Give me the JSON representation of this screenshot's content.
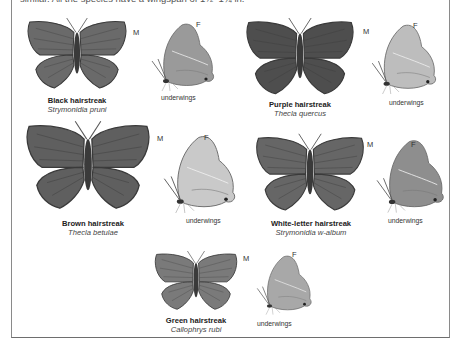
{
  "intro_text": "similar. All the species have a wingspan of 1½–1¾ in.",
  "species": [
    {
      "common": "Black hairstreak",
      "latin": "Strymonidia pruni",
      "underwing_label": "underwings",
      "male_label": "M",
      "female_label": "F",
      "upper_color": "#6a6a6a",
      "under_color": "#9a9a9a",
      "icon": "butterfly-icon"
    },
    {
      "common": "Purple hairstreak",
      "latin": "Thecla quercus",
      "underwing_label": "underwings",
      "male_label": "M",
      "female_label": "F",
      "upper_color": "#4e4e4e",
      "under_color": "#bdbdbd",
      "icon": "butterfly-icon"
    },
    {
      "common": "Brown hairstreak",
      "latin": "Thecla betulae",
      "underwing_label": "underwings",
      "male_label": "M",
      "female_label": "F",
      "upper_color": "#5f5f5f",
      "under_color": "#c9c9c9",
      "icon": "butterfly-icon"
    },
    {
      "common": "White-letter hairstreak",
      "latin": "Strymonidia w-album",
      "underwing_label": "underwings",
      "male_label": "M",
      "female_label": "F",
      "upper_color": "#666666",
      "under_color": "#8e8e8e",
      "icon": "butterfly-icon"
    },
    {
      "common": "Green hairstreak",
      "latin": "Callophrys rubi",
      "underwing_label": "underwings",
      "male_label": "M",
      "female_label": "F",
      "upper_color": "#7a7a7a",
      "under_color": "#a8a8a8",
      "icon": "butterfly-icon"
    }
  ]
}
